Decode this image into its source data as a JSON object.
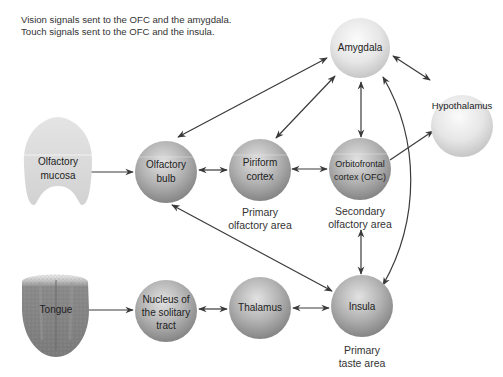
{
  "captions": {
    "vision": "Vision signals sent to the OFC and the amygdala.",
    "touch": "Touch signals sent to the OFC and the insula."
  },
  "nodes": {
    "amygdala": {
      "label": "Amygdala",
      "shade": "light"
    },
    "hypothalamus": {
      "label": "Hypothalamus",
      "shade": "light"
    },
    "olfactory_mucosa": {
      "line1": "Olfactory",
      "line2": "mucosa"
    },
    "olfactory_bulb": {
      "line1": "Olfactory",
      "line2": "bulb",
      "shade": "dark"
    },
    "piriform_cortex": {
      "line1": "Piriform",
      "line2": "cortex",
      "shade": "dark"
    },
    "ofc": {
      "line1": "Orbitofrontal",
      "line2": "cortex (OFC)",
      "shade": "dark"
    },
    "tongue": {
      "label": "Tongue"
    },
    "nts": {
      "line1": "Nucleus of",
      "line2": "the solitary",
      "line3": "tract",
      "shade": "dark"
    },
    "thalamus": {
      "label": "Thalamus",
      "shade": "dark"
    },
    "insula": {
      "label": "Insula",
      "shade": "dark"
    }
  },
  "area_labels": {
    "primary_olfactory": {
      "line1": "Primary",
      "line2": "olfactory area"
    },
    "secondary_olfactory": {
      "line1": "Secondary",
      "line2": "olfactory area"
    },
    "primary_taste": {
      "line1": "Primary",
      "line2": "taste area"
    }
  },
  "colors": {
    "arrow": "#3a3a3a",
    "sphere_dark_center": "#d8d8d8",
    "sphere_dark_edge": "#8a8a8a",
    "sphere_light_center": "#f7f7f7",
    "sphere_light_edge": "#c9c9c9"
  }
}
